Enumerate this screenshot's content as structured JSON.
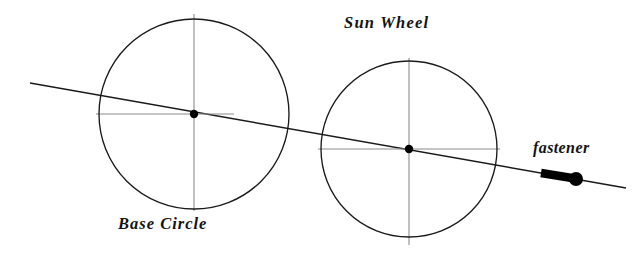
{
  "figure": {
    "type": "technical-line-diagram",
    "background_color": "#ffffff",
    "width": 633,
    "height": 257,
    "outline_color": "#1a1a1a",
    "centerline_color": "#8c8c8c",
    "marker_color": "#000000"
  },
  "labels": {
    "sun_wheel": "Sun Wheel",
    "base_circle": "Base Circle",
    "fastener": "fastener"
  },
  "geometry": {
    "base_circle": {
      "name": "Base Circle",
      "center_x": 194,
      "center_y": 114,
      "radius": 95,
      "vertical_centerline": {
        "x": 194,
        "y1": 14,
        "y2": 211
      },
      "horizontal_centerline": {
        "y": 114,
        "x1": 96,
        "x2": 234
      },
      "center_dot_radius": 4.2
    },
    "sun_wheel": {
      "name": "Sun Wheel",
      "center_x": 409,
      "center_y": 149,
      "radius": 88,
      "vertical_centerline": {
        "x": 409,
        "y1": 58,
        "y2": 245
      },
      "horizontal_centerline": {
        "y": 149,
        "x1": 318,
        "x2": 500
      },
      "center_dot_radius": 4.2
    },
    "center_line": {
      "name": "line-of-centers",
      "x1": 30,
      "y1": 83,
      "x2": 626,
      "y2": 188,
      "stroke_width": 1.5
    },
    "fastener": {
      "name": "fastener",
      "shank_start_x": 541,
      "shank_start_y": 173,
      "shank_end_x": 572,
      "shank_end_y": 178,
      "shank_width": 8.5,
      "head_x": 576,
      "head_y": 179,
      "head_radius": 7
    }
  }
}
